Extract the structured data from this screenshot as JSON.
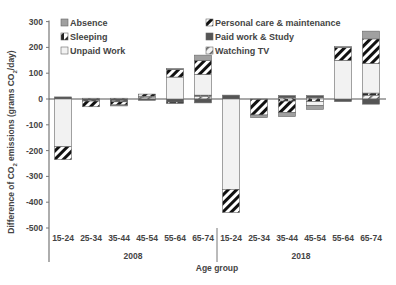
{
  "chart_data": {
    "type": "bar",
    "stacked": true,
    "title": "",
    "xlabel": "Age group",
    "ylabel": "Difference of CO2 emissions (grams CO2/day)",
    "ylabel_parts": {
      "pre": "Difference of CO",
      "sub": "2",
      "mid": " emissions (grams CO",
      "sub2": "2",
      "post": "/day)"
    },
    "ylim": [
      -500,
      300
    ],
    "yticks": [
      300,
      200,
      100,
      0,
      -100,
      -200,
      -300,
      -400,
      -500
    ],
    "grid": false,
    "legend_position": "top-inside",
    "groups": [
      {
        "label": "2008",
        "categories": [
          "15-24",
          "25-34",
          "35-44",
          "45-54",
          "55-64",
          "65-74"
        ]
      },
      {
        "label": "2018",
        "categories": [
          "15-24",
          "25-34",
          "35-44",
          "45-54",
          "55-64",
          "65-74"
        ]
      }
    ],
    "categories": [
      "2008 15-24",
      "2008 25-34",
      "2008 35-44",
      "2008 45-54",
      "2008 55-64",
      "2008 65-74",
      "2018 15-24",
      "2018 25-34",
      "2018 35-44",
      "2018 45-54",
      "2018 55-64",
      "2018 65-74"
    ],
    "series": [
      {
        "name": "Absence",
        "pattern": "light-gray-fill",
        "color": "#9e9e9e",
        "values": [
          0,
          0,
          -3,
          0,
          3,
          20,
          0,
          -10,
          -15,
          -15,
          3,
          30
        ]
      },
      {
        "name": "Sleeping",
        "pattern": "half-diagonal",
        "color": "#222222",
        "values": [
          0,
          -3,
          -5,
          3,
          -5,
          5,
          0,
          0,
          -8,
          -10,
          0,
          8
        ]
      },
      {
        "name": "Unpaid Work",
        "pattern": "white-fill",
        "color": "#f2f2f2",
        "values": [
          -185,
          0,
          0,
          0,
          85,
          80,
          -350,
          0,
          0,
          -15,
          150,
          115
        ]
      },
      {
        "name": "Personal care & maintenance",
        "pattern": "diagonal-stripes",
        "color": "#111111",
        "values": [
          -50,
          -22,
          -12,
          8,
          30,
          55,
          -90,
          -60,
          -45,
          0,
          50,
          95
        ]
      },
      {
        "name": "Paid work & Study",
        "pattern": "dark-gray-fill",
        "color": "#555555",
        "values": [
          8,
          -5,
          -6,
          -5,
          -12,
          -15,
          15,
          -2,
          8,
          8,
          -10,
          -20
        ]
      },
      {
        "name": "Watching TV",
        "pattern": "white-with-stripe",
        "color": "#dddddd",
        "values": [
          0,
          3,
          3,
          8,
          0,
          10,
          0,
          0,
          5,
          5,
          0,
          15
        ]
      }
    ]
  },
  "legend": {
    "left": [
      "Absence",
      "Sleeping",
      "Unpaid Work"
    ],
    "right": [
      "Personal care & maintenance",
      "Paid work & Study",
      "Watching TV"
    ]
  },
  "axis": {
    "x_title": "Age group",
    "group_labels": [
      "2008",
      "2018"
    ]
  }
}
